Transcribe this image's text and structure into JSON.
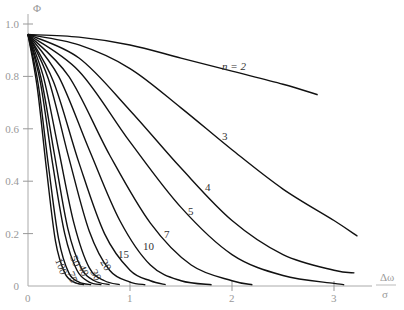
{
  "chart_data": {
    "type": "line",
    "title": "",
    "xlabel": "Δω / σ",
    "xlabel_num": "Δω",
    "xlabel_den": "σ",
    "ylabel": "Φ",
    "xlim": [
      0,
      3.3
    ],
    "ylim": [
      0,
      1.0
    ],
    "x_ticks": [
      0,
      1,
      2,
      3
    ],
    "x_tick_labels": [
      "0",
      "1",
      "2",
      "3"
    ],
    "y_ticks": [
      0,
      0.2,
      0.4,
      0.6,
      0.8,
      1.0
    ],
    "y_tick_labels": [
      "0",
      "0.2",
      "0.4",
      "0.6",
      "0.8",
      "1.0"
    ],
    "grid": false,
    "legend": "none (inline curve labels)",
    "series": [
      {
        "name": "n = 2",
        "label": "n = 2",
        "x": [
          0,
          0.5,
          1.0,
          1.5,
          2.0,
          2.5,
          2.84
        ],
        "y": [
          0.96,
          0.95,
          0.92,
          0.87,
          0.82,
          0.77,
          0.73
        ]
      },
      {
        "name": "3",
        "label": "3",
        "x": [
          0,
          0.5,
          1.0,
          1.5,
          2.0,
          2.5,
          3.0,
          3.23
        ],
        "y": [
          0.96,
          0.92,
          0.83,
          0.68,
          0.52,
          0.37,
          0.25,
          0.19
        ]
      },
      {
        "name": "4",
        "label": "4",
        "x": [
          0,
          0.5,
          1.0,
          1.5,
          2.0,
          2.5,
          3.0,
          3.2
        ],
        "y": [
          0.96,
          0.87,
          0.67,
          0.45,
          0.25,
          0.12,
          0.06,
          0.05
        ]
      },
      {
        "name": "5",
        "label": "5",
        "x": [
          0,
          0.5,
          1.0,
          1.5,
          2.0,
          2.5,
          3.0,
          3.1
        ],
        "y": [
          0.96,
          0.82,
          0.55,
          0.3,
          0.12,
          0.04,
          0.01,
          0.005
        ]
      },
      {
        "name": "7",
        "label": "7",
        "x": [
          0,
          0.4,
          0.8,
          1.2,
          1.6,
          2.0,
          2.2
        ],
        "y": [
          0.96,
          0.8,
          0.5,
          0.24,
          0.08,
          0.02,
          0.005
        ]
      },
      {
        "name": "10",
        "label": "10",
        "x": [
          0,
          0.3,
          0.6,
          0.9,
          1.2,
          1.5,
          1.8
        ],
        "y": [
          0.96,
          0.8,
          0.52,
          0.25,
          0.08,
          0.02,
          0.005
        ]
      },
      {
        "name": "15",
        "label": "15",
        "x": [
          0,
          0.25,
          0.5,
          0.75,
          1.0,
          1.2,
          1.35
        ],
        "y": [
          0.96,
          0.78,
          0.47,
          0.2,
          0.06,
          0.02,
          0.005
        ]
      },
      {
        "name": "20",
        "label": "20",
        "x": [
          0,
          0.2,
          0.4,
          0.6,
          0.8,
          1.0,
          1.15
        ],
        "y": [
          0.96,
          0.79,
          0.49,
          0.21,
          0.06,
          0.015,
          0.005
        ]
      },
      {
        "name": "30",
        "label": "30",
        "x": [
          0,
          0.15,
          0.3,
          0.45,
          0.6,
          0.75,
          0.9
        ],
        "y": [
          0.96,
          0.8,
          0.52,
          0.24,
          0.07,
          0.02,
          0.005
        ]
      },
      {
        "name": "40",
        "label": "40",
        "x": [
          0,
          0.13,
          0.26,
          0.39,
          0.52,
          0.65,
          0.8
        ],
        "y": [
          0.96,
          0.79,
          0.5,
          0.22,
          0.07,
          0.02,
          0.005
        ]
      },
      {
        "name": "50",
        "label": "50",
        "x": [
          0,
          0.12,
          0.24,
          0.36,
          0.48,
          0.6,
          0.72
        ],
        "y": [
          0.96,
          0.78,
          0.47,
          0.2,
          0.06,
          0.015,
          0.005
        ]
      },
      {
        "name": "75",
        "label": "75",
        "x": [
          0,
          0.1,
          0.2,
          0.3,
          0.4,
          0.5,
          0.62
        ],
        "y": [
          0.96,
          0.77,
          0.46,
          0.18,
          0.05,
          0.015,
          0.005
        ]
      },
      {
        "name": "100",
        "label": "100",
        "x": [
          0,
          0.09,
          0.18,
          0.27,
          0.36,
          0.45,
          0.55
        ],
        "y": [
          0.96,
          0.76,
          0.45,
          0.17,
          0.05,
          0.015,
          0.005
        ]
      }
    ]
  }
}
